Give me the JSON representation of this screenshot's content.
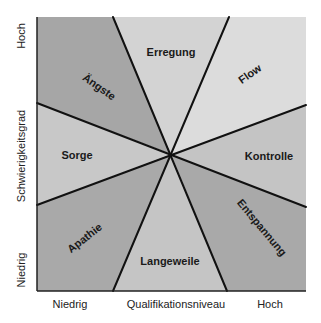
{
  "diagram": {
    "center": {
      "x": 171,
      "y": 154
    },
    "box": {
      "x1": 37,
      "y1": 17,
      "x2": 306,
      "y2": 291
    },
    "regions": [
      {
        "name": "Ängste",
        "color": "#a6a6a6",
        "label_pos": {
          "x": 97,
          "y": 90
        },
        "rotate": 35
      },
      {
        "name": "Erregung",
        "color": "#d3d3d3",
        "label_pos": {
          "x": 171,
          "y": 56
        },
        "rotate": 0
      },
      {
        "name": "Flow",
        "color": "#dcdcdc",
        "label_pos": {
          "x": 252,
          "y": 77
        },
        "rotate": -35
      },
      {
        "name": "Kontrolle",
        "color": "#c4c4c4",
        "label_pos": {
          "x": 269,
          "y": 160
        },
        "rotate": 0
      },
      {
        "name": "Entspannung",
        "color": "#a9a9a9",
        "label_pos": {
          "x": 259,
          "y": 230
        },
        "rotate": 50
      },
      {
        "name": "Langeweile",
        "color": "#c5c5c5",
        "label_pos": {
          "x": 170,
          "y": 265
        },
        "rotate": 0
      },
      {
        "name": "Apathie",
        "color": "#a9a9a9",
        "label_pos": {
          "x": 87,
          "y": 241
        },
        "rotate": -38
      },
      {
        "name": "Sorge",
        "color": "#c8c8c8",
        "label_pos": {
          "x": 77,
          "y": 159
        },
        "rotate": 0
      }
    ],
    "y_axis": {
      "title": "Schwierigkeitsgrad",
      "high": "Hoch",
      "low": "Niedrig"
    },
    "x_axis": {
      "title": "Qualifikationsniveau",
      "low": "Niedrig",
      "high": "Hoch"
    }
  }
}
